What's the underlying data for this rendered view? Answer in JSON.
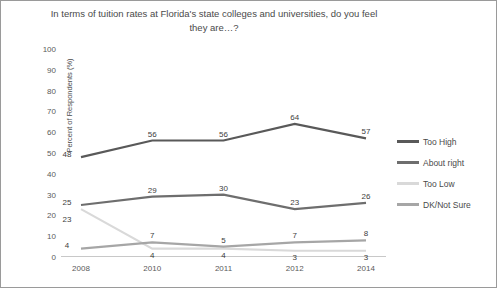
{
  "chart_data": {
    "type": "line",
    "title": "In terms of tuition rates at Florida's state colleges and universities, do you feel they are…?",
    "xlabel": "",
    "ylabel": "Percent of Respondents (%)",
    "ylim": [
      0,
      100
    ],
    "ytick_step": 10,
    "yticks": [
      "100",
      "90",
      "80",
      "70",
      "60",
      "50",
      "40",
      "30",
      "20",
      "10",
      "0"
    ],
    "categories": [
      "2008",
      "2010",
      "2011",
      "2012",
      "2014"
    ],
    "grid": false,
    "legend_position": "right",
    "series": [
      {
        "name": "Too High",
        "color": "#595959",
        "values": [
          48,
          56,
          56,
          64,
          57
        ],
        "labels": [
          "48",
          "56",
          "56",
          "64",
          "57"
        ]
      },
      {
        "name": "About right",
        "color": "#6e6e6e",
        "values": [
          25,
          29,
          30,
          23,
          26
        ],
        "labels": [
          "25",
          "29",
          "30",
          "23",
          "26"
        ]
      },
      {
        "name": "Too Low",
        "color": "#d9d9d9",
        "values": [
          23,
          4,
          4,
          3,
          3
        ],
        "labels": [
          "23",
          "4",
          "4",
          "3",
          "3"
        ]
      },
      {
        "name": "DK/Not Sure",
        "color": "#a6a6a6",
        "values": [
          4,
          7,
          5,
          7,
          8
        ],
        "labels": [
          "4",
          "7",
          "5",
          "7",
          "8"
        ]
      }
    ]
  }
}
